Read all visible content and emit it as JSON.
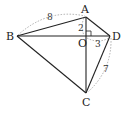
{
  "diagram": {
    "points": {
      "A": "A",
      "B": "B",
      "C": "C",
      "D": "D",
      "O": "O"
    },
    "measurements": {
      "AB": "8",
      "AO": "2",
      "OD": "3",
      "CD": "7"
    },
    "right_angle_at": "O"
  }
}
